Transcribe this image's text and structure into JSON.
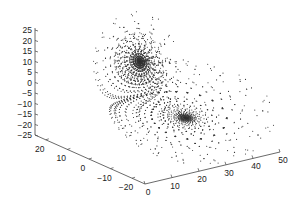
{
  "chart_data": {
    "type": "scatter",
    "subtype": "scatter3d",
    "title": "",
    "xlabel": "",
    "ylabel": "",
    "zlabel": "",
    "axes": {
      "x": {
        "ticks": [
          0,
          10,
          20,
          30,
          40,
          50
        ],
        "range": [
          0,
          50
        ]
      },
      "y": {
        "ticks": [
          20,
          10,
          0,
          -10,
          -20
        ],
        "range": [
          -25,
          25
        ]
      },
      "z": {
        "ticks": [
          25,
          20,
          15,
          10,
          5,
          0,
          -5,
          -10,
          -15,
          -20,
          -25
        ],
        "range": [
          -25,
          25
        ]
      }
    },
    "grid": false,
    "legend": null,
    "lorenz_params": {
      "sigma": 10,
      "rho": 28,
      "beta": 2.6667
    },
    "marker": {
      "style": "dot",
      "color": "#333333",
      "size": 1
    }
  },
  "labels": {
    "z_ticks": [
      "25",
      "20",
      "15",
      "10",
      "5",
      "0",
      "−5",
      "−10",
      "−15",
      "−20",
      "−25"
    ],
    "y_ticks": [
      "20",
      "10",
      "0",
      "−10",
      "−20"
    ],
    "x_ticks": [
      "0",
      "10",
      "20",
      "30",
      "40",
      "50"
    ]
  }
}
